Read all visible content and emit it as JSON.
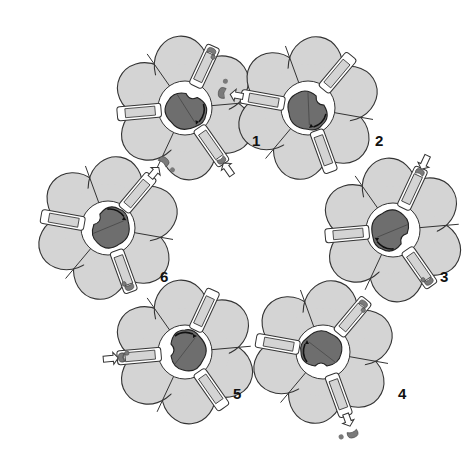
{
  "diagram": {
    "type": "rotary-cycle",
    "colors": {
      "domain_fill": "#d4d4d4",
      "rotor_fill": "#6e6e6e",
      "outline": "#333333",
      "ligand_fill": "#7a7a7a",
      "background": "#ffffff"
    },
    "states": [
      {
        "label": "1",
        "cx": 185,
        "cy": 108,
        "rotor_angle": 200,
        "arrow": "up-left",
        "event": "ligand-in",
        "event_channel": 2,
        "label_x": 252,
        "label_y": 147
      },
      {
        "label": "2",
        "cx": 308,
        "cy": 108,
        "rotor_angle": 230,
        "arrow": "up-left",
        "event": "ligand-out",
        "event_channel": 0,
        "label_x": 375,
        "label_y": 147
      },
      {
        "label": "3",
        "cx": 393,
        "cy": 230,
        "rotor_angle": 300,
        "arrow": "right",
        "event": "ligand-in",
        "event_channel": 1,
        "label_x": 440,
        "label_y": 283
      },
      {
        "label": "4",
        "cx": 323,
        "cy": 352,
        "rotor_angle": 0,
        "arrow": "down",
        "event": "ligand-out",
        "event_channel": 2,
        "label_x": 398,
        "label_y": 400
      },
      {
        "label": "5",
        "cx": 185,
        "cy": 352,
        "rotor_angle": 90,
        "arrow": "down-left",
        "event": "ligand-in",
        "event_channel": 0,
        "label_x": 233,
        "label_y": 400
      },
      {
        "label": "6",
        "cx": 108,
        "cy": 228,
        "rotor_angle": 120,
        "arrow": "left",
        "event": "ligand-out",
        "event_channel": 1,
        "label_x": 160,
        "label_y": 283
      }
    ]
  }
}
